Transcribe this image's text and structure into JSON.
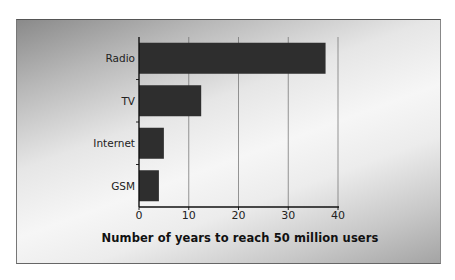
{
  "chart_data": {
    "type": "bar",
    "orientation": "horizontal",
    "title": "",
    "categories": [
      "Radio",
      "TV",
      "Internet",
      "GSM"
    ],
    "values": [
      37.5,
      12.5,
      5,
      4
    ],
    "xlabel": "Number of years to reach 50 million users",
    "ylabel": "",
    "xlim": [
      0,
      40
    ],
    "xticks": [
      "0",
      "10",
      "20",
      "30",
      "40"
    ],
    "grid": "vertical",
    "legend": null,
    "bar_color": "#2e2e2e"
  },
  "labels": {
    "categories": [
      "Radio",
      "TV",
      "Internet",
      "GSM"
    ],
    "ticks": [
      "0",
      "10",
      "20",
      "30",
      "40"
    ],
    "x_title": "Number of years to reach 50 million users"
  }
}
